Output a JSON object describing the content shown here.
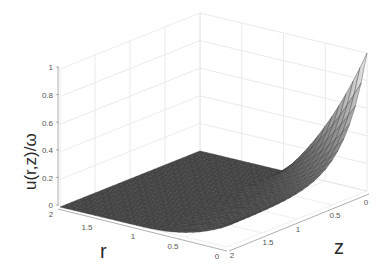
{
  "chart_data": {
    "type": "surface3d",
    "title": "",
    "xlabel": "r",
    "ylabel": "z",
    "zlabel": "u(r,z)/ω",
    "x_ticks": [
      "0",
      "0.5",
      "1",
      "1.5",
      "2"
    ],
    "y_ticks": [
      "0",
      "0.5",
      "1",
      "1.5",
      "2"
    ],
    "z_ticks": [
      "0",
      "0.2",
      "0.4",
      "0.6",
      "0.8",
      "1"
    ],
    "xlim": [
      0,
      2
    ],
    "ylim": [
      0,
      2
    ],
    "zlim": [
      0,
      1
    ],
    "grid": true,
    "colormap": "gray",
    "peak": {
      "r": 0,
      "z": 0,
      "u": 1.0
    },
    "samples": [
      {
        "r": 0.0,
        "z": 0.0,
        "u": 1.0
      },
      {
        "r": 0.25,
        "z": 0.0,
        "u": 0.75
      },
      {
        "r": 0.5,
        "z": 0.0,
        "u": 0.5
      },
      {
        "r": 0.75,
        "z": 0.0,
        "u": 0.25
      },
      {
        "r": 1.0,
        "z": 0.0,
        "u": 0.02
      },
      {
        "r": 0.0,
        "z": 0.25,
        "u": 0.35
      },
      {
        "r": 0.0,
        "z": 0.5,
        "u": 0.15
      },
      {
        "r": 0.0,
        "z": 1.0,
        "u": 0.03
      },
      {
        "r": 0.5,
        "z": 0.5,
        "u": 0.08
      },
      {
        "r": 2.0,
        "z": 2.0,
        "u": 0.0
      }
    ]
  },
  "axes": {
    "r_label": "r",
    "z_label": "z",
    "u_label": "u(r,z)/ω",
    "u_ticks": [
      "1",
      "0.8",
      "0.6",
      "0.4",
      "0.2",
      "0"
    ],
    "r_ticks": [
      "2",
      "1.5",
      "1",
      "0.5",
      "0"
    ],
    "z_ticks": [
      "2",
      "1.5",
      "1",
      "0.5",
      "0"
    ]
  },
  "colors": {
    "surface_dark": "#474747",
    "surface_light": "#e6e6e6",
    "mesh": "#2e2e2e",
    "grid": "#e4e4e4",
    "axis": "#9a9a9a"
  }
}
